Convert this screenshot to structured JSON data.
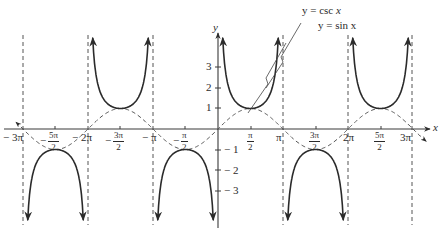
{
  "chart_data": {
    "type": "line",
    "title": "",
    "xlabel": "x",
    "ylabel": "y",
    "xlim": [
      -9.42,
      9.42
    ],
    "ylim": [
      -3.6,
      4.2
    ],
    "grid": false,
    "legend": "annotation labels with leader lines (top right)",
    "series": [
      {
        "name": "y = csc x",
        "style": "solid",
        "expression": "1/sin(x)",
        "branches": 6,
        "local_minima": [
          [
            -4.712,
            1
          ],
          [
            1.571,
            1
          ],
          [
            7.854,
            1
          ]
        ],
        "local_maxima": [
          [
            -7.854,
            -1
          ],
          [
            -1.571,
            -1
          ],
          [
            4.712,
            -1
          ]
        ]
      },
      {
        "name": "y = sin x",
        "style": "dashed",
        "expression": "sin(x)",
        "range": [
          -1,
          1
        ]
      }
    ],
    "vertical_asymptotes": [
      "-3π",
      "-2π",
      "-π",
      "0",
      "π",
      "2π",
      "3π"
    ],
    "x_ticks": [
      {
        "value": -9.4248,
        "label": "− 3π"
      },
      {
        "value": -7.854,
        "label": "− 5π/2",
        "sign": "−",
        "num": "5π",
        "den": "2"
      },
      {
        "value": -6.2832,
        "label": "− 2π"
      },
      {
        "value": -4.712,
        "label": "− 3π/2",
        "sign": "−",
        "num": "3π",
        "den": "2"
      },
      {
        "value": -3.1416,
        "label": "− π"
      },
      {
        "value": -1.5708,
        "label": "− π/2",
        "sign": "−",
        "num": "π",
        "den": "2"
      },
      {
        "value": 1.5708,
        "label": "π/2",
        "num": "π",
        "den": "2"
      },
      {
        "value": 3.1416,
        "label": "π"
      },
      {
        "value": 4.712,
        "label": "3π/2",
        "num": "3π",
        "den": "2"
      },
      {
        "value": 6.2832,
        "label": "2π"
      },
      {
        "value": 7.854,
        "label": "5π/2",
        "num": "5π",
        "den": "2"
      },
      {
        "value": 9.4248,
        "label": "3π"
      }
    ],
    "y_ticks": [
      {
        "value": 3,
        "label": "3"
      },
      {
        "value": 2,
        "label": "2"
      },
      {
        "value": 1,
        "label": "1"
      },
      {
        "value": -1,
        "label": "− 1"
      },
      {
        "value": -2,
        "label": "− 2"
      },
      {
        "value": -3,
        "label": "− 3"
      }
    ],
    "annotations": [
      {
        "text": "y = csc x",
        "points_to": "csc branch near x=π/2..π"
      },
      {
        "text": "y = sin x",
        "points_to": "sine curve near x=π/2..π"
      }
    ],
    "colors": {
      "curve": "#2b2b2b",
      "axis": "#3a3a3a",
      "asymptote": "#555555",
      "background": "#ffffff"
    }
  },
  "labels": {
    "x_axis": "x",
    "y_axis": "y",
    "csc_legend_prefix": "y = csc ",
    "csc_legend_var": "x",
    "sin_legend": "y = sin x",
    "xt_m3pi": "− 3π",
    "xt_m2pi": "− 2π",
    "xt_mpi": "− π",
    "xt_pi": "π",
    "xt_2pi": "2π",
    "xt_3pi": "3π",
    "minus": "−",
    "f_5pi": "5π",
    "f_3pi": "3π",
    "f_pi": "π",
    "f_2": "2",
    "yt_3": "3",
    "yt_2": "2",
    "yt_1": "1",
    "yt_m1": "− 1",
    "yt_m2": "− 2",
    "yt_m3": "− 3"
  }
}
